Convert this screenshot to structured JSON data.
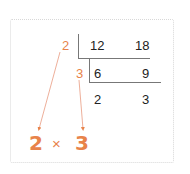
{
  "diagram": {
    "divisors": [
      "2",
      "3"
    ],
    "rows": [
      {
        "left": "12",
        "right": "18"
      },
      {
        "left": "6",
        "right": "9"
      },
      {
        "left": "2",
        "right": "3"
      }
    ],
    "result": {
      "factor1": "2",
      "operator": "×",
      "factor2": "3"
    },
    "colors": {
      "accent": "#e8834a",
      "text": "#222222",
      "lines": "#777777",
      "frame": "#d8d8d8"
    }
  }
}
